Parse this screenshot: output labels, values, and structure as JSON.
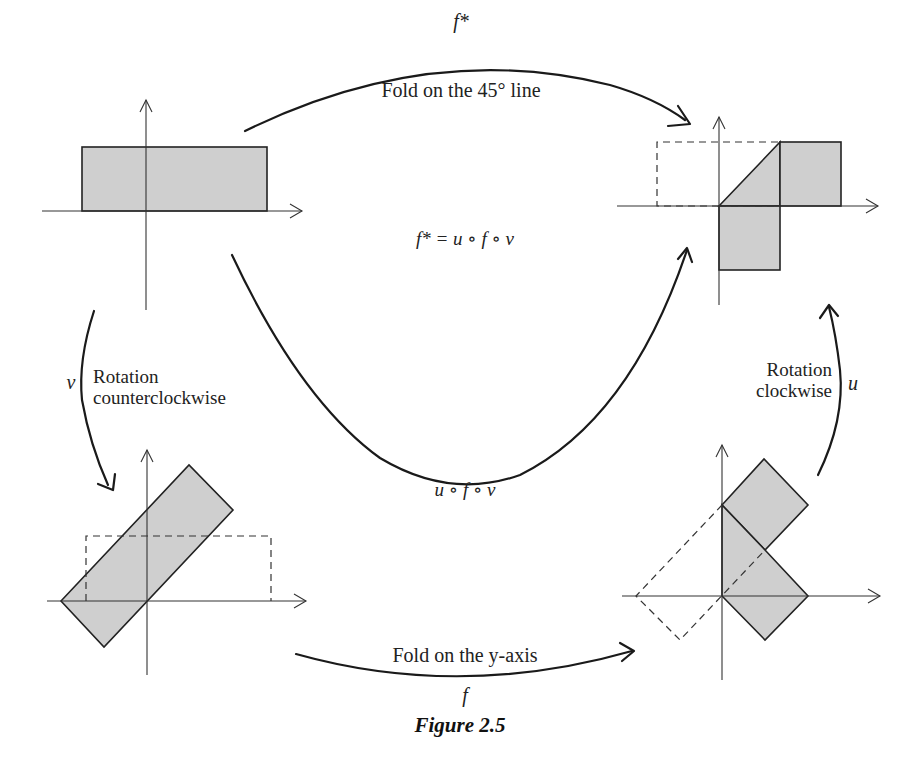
{
  "figure": {
    "caption": "Figure 2.5",
    "panels": {
      "top_left": {
        "description": "original rectangle"
      },
      "top_right": {
        "description": "result of fold on the 45° line"
      },
      "bottom_left": {
        "description": "rectangle rotated counterclockwise"
      },
      "bottom_right": {
        "description": "rotated rectangle folded on the y-axis"
      }
    },
    "arrows": {
      "top": {
        "symbol": "f*",
        "label": "Fold on the 45° line"
      },
      "left": {
        "symbol": "v",
        "label_line1": "Rotation",
        "label_line2": "counterclockwise"
      },
      "bottom": {
        "symbol": "f",
        "label": "Fold on the y-axis"
      },
      "right": {
        "symbol": "u",
        "label_line1": "Rotation",
        "label_line2": "clockwise"
      },
      "center": {
        "symbol": "u ∘ f ∘ v"
      }
    },
    "equation": "f* = u ∘ f ∘ v",
    "colors": {
      "shade": "#cfcfcf",
      "stroke": "#222222"
    }
  }
}
